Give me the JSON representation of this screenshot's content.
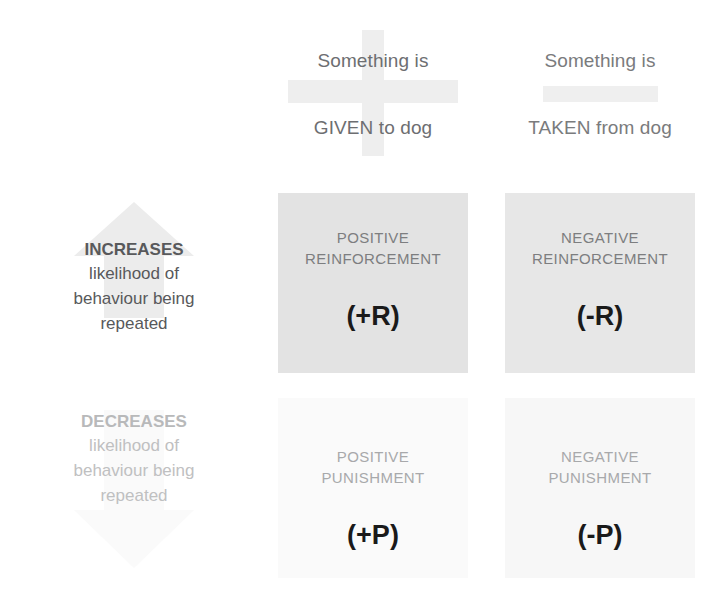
{
  "diagram": {
    "columns": [
      {
        "id": "given",
        "symbol": "plus-sign",
        "line1": "Something is",
        "line2": "GIVEN to dog"
      },
      {
        "id": "taken",
        "symbol": "minus-sign",
        "line1": "Something is",
        "line2": "TAKEN from dog"
      }
    ],
    "rows": [
      {
        "id": "increases",
        "arrow": "arrow-up-icon",
        "strong": "INCREASES",
        "line2": "likelihood of",
        "line3": "behaviour being",
        "line4": "repeated"
      },
      {
        "id": "decreases",
        "arrow": "arrow-down-icon",
        "strong": "DECREASES",
        "line2": "likelihood of",
        "line3": "behaviour being",
        "line4": "repeated"
      }
    ],
    "cells": [
      {
        "id": "positive-reinforcement",
        "title_line1": "POSITIVE",
        "title_line2": "REINFORCEMENT",
        "code": "(+R)"
      },
      {
        "id": "negative-reinforcement",
        "title_line1": "NEGATIVE",
        "title_line2": "REINFORCEMENT",
        "code": "(-R)"
      },
      {
        "id": "positive-punishment",
        "title_line1": "POSITIVE",
        "title_line2": "PUNISHMENT",
        "code": "(+P)"
      },
      {
        "id": "negative-punishment",
        "title_line1": "NEGATIVE",
        "title_line2": "PUNISHMENT",
        "code": "(-P)"
      }
    ],
    "colors": {
      "text_dark": "#58595b",
      "text_mid": "#7d7e80",
      "text_faded": "#b8b9ba",
      "cell_strong": "#e3e3e3",
      "cell_faint": "#fafafa",
      "symbol_gray": "#eeeeee"
    }
  }
}
